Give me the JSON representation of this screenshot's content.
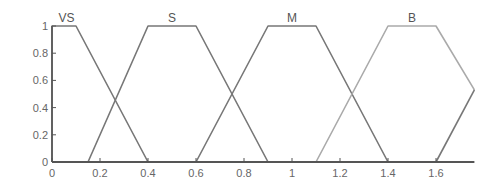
{
  "chart_data": {
    "type": "line",
    "title": "",
    "xlabel": "",
    "ylabel": "",
    "xlim": [
      0,
      1.76
    ],
    "ylim": [
      0,
      1
    ],
    "grid": false,
    "legend": "none",
    "x_ticks": [
      "0",
      "0.2",
      "0.4",
      "0.6",
      "0.8",
      "1",
      "1.2",
      "1.4",
      "1.6"
    ],
    "x_tick_values": [
      0,
      0.2,
      0.4,
      0.6,
      0.8,
      1.0,
      1.2,
      1.4,
      1.6
    ],
    "y_ticks": [
      "0",
      "0.2",
      "0.4",
      "0.6",
      "0.8",
      "1"
    ],
    "y_tick_values": [
      0,
      0.2,
      0.4,
      0.6,
      0.8,
      1.0
    ],
    "series": [
      {
        "name": "VS",
        "shape": "trapezoid",
        "params": [
          0,
          0,
          0.1,
          0.4
        ],
        "x": [
          0,
          0,
          0.1,
          0.4
        ],
        "y": [
          0,
          1,
          1,
          0
        ],
        "color": "#777777"
      },
      {
        "name": "S",
        "shape": "trapezoid",
        "params": [
          0.15,
          0.4,
          0.6,
          0.9
        ],
        "x": [
          0.15,
          0.4,
          0.6,
          0.9
        ],
        "y": [
          0,
          1,
          1,
          0
        ],
        "color": "#777777"
      },
      {
        "name": "M",
        "shape": "trapezoid",
        "params": [
          0.6,
          0.9,
          1.1,
          1.4
        ],
        "x": [
          0.6,
          0.9,
          1.1,
          1.4
        ],
        "y": [
          0,
          1,
          1,
          0
        ],
        "color": "#777777"
      },
      {
        "name": "B",
        "shape": "trapezoid",
        "params": [
          1.1,
          1.4,
          1.6,
          1.9
        ],
        "x": [
          1.1,
          1.4,
          1.6,
          1.76
        ],
        "y": [
          0,
          1,
          1,
          0.53
        ],
        "color": "#aaaaaa"
      },
      {
        "name": "",
        "shape": "rising",
        "x": [
          1.6,
          1.76
        ],
        "y": [
          0,
          0.53
        ],
        "color": "#777777"
      }
    ],
    "annotations": [
      "VS",
      "S",
      "M",
      "B"
    ]
  }
}
